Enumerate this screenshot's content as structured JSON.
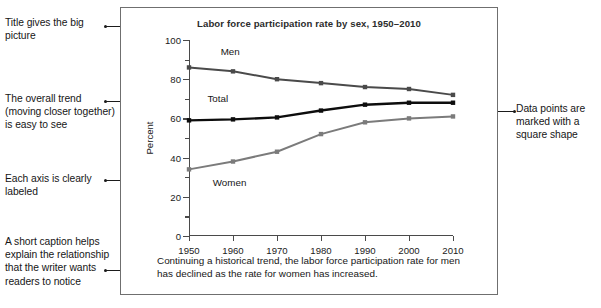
{
  "annotations": {
    "left": [
      {
        "name": "annotation-title",
        "text": "Title gives the big picture"
      },
      {
        "name": "annotation-trend",
        "text": "The overall trend (moving closer together) is easy to see"
      },
      {
        "name": "annotation-axis",
        "text": "Each axis is clearly labeled"
      },
      {
        "name": "annotation-caption",
        "text": "A short caption helps explain the relationship that the writer wants readers to notice"
      }
    ],
    "right": [
      {
        "name": "annotation-markers",
        "text": "Data points are marked with a square shape"
      }
    ]
  },
  "figure": {
    "caption": "Continuing a historical trend, the labor force participation rate for men has declined as the rate for women has increased."
  },
  "chart_data": {
    "type": "line",
    "title": "Labor force participation rate by sex, 1950–2010",
    "xlabel": "",
    "ylabel": "Percent",
    "x": [
      1950,
      1960,
      1970,
      1980,
      1990,
      2000,
      2010
    ],
    "xtick_labels": [
      "1950",
      "1960",
      "1970",
      "1980",
      "1990",
      "2000",
      "2010"
    ],
    "ytick_labels": [
      "0",
      "20",
      "40",
      "60",
      "80",
      "100"
    ],
    "ytick_values": [
      0,
      20,
      40,
      60,
      80,
      100
    ],
    "yminor_values": [
      10,
      30,
      50,
      70,
      90
    ],
    "ylim": [
      0,
      100
    ],
    "xlim": [
      1950,
      2010
    ],
    "grid": false,
    "legend": "inline-labels",
    "marker": "square",
    "series": [
      {
        "name": "Men",
        "label": "Men",
        "color": "#4a4a4a",
        "values": [
          86,
          84,
          80,
          78,
          76,
          75,
          72
        ]
      },
      {
        "name": "Total",
        "label": "Total",
        "color": "#0d0d0d",
        "values": [
          59,
          59.5,
          60.5,
          64,
          67,
          68,
          68
        ]
      },
      {
        "name": "Women",
        "label": "Women",
        "color": "#7b7b7b",
        "values": [
          34,
          38,
          43,
          52,
          58,
          60,
          61
        ]
      }
    ],
    "series_label_positions": [
      {
        "series": "Men",
        "x_frac": 0.12,
        "y_value": 94
      },
      {
        "series": "Total",
        "x_frac": 0.07,
        "y_value": 70
      },
      {
        "series": "Women",
        "x_frac": 0.09,
        "y_value": 27
      }
    ]
  }
}
